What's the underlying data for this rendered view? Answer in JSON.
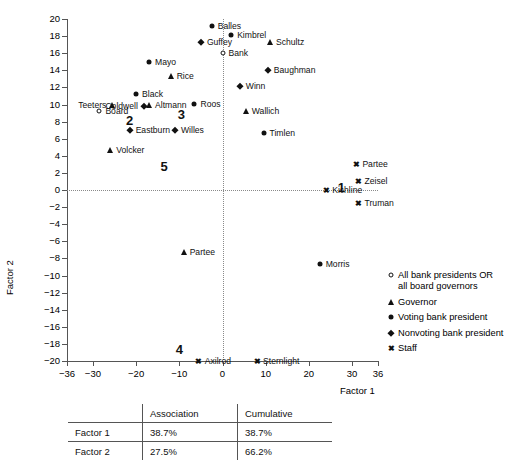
{
  "chart_data": {
    "type": "scatter",
    "title": "",
    "xlabel": "Factor 1",
    "ylabel": "Factor 2",
    "xlim": [
      -36,
      36
    ],
    "ylim": [
      -20,
      20
    ],
    "xticks": [
      -36,
      -30,
      -20,
      -10,
      0,
      10,
      20,
      30,
      36
    ],
    "yticks": [
      20,
      18,
      16,
      14,
      12,
      10,
      8,
      6,
      4,
      2,
      0,
      -2,
      -4,
      -6,
      -8,
      -10,
      -12,
      -14,
      -16,
      -18,
      -20
    ],
    "grid": false,
    "reference_lines": {
      "x": 0,
      "y": 0,
      "style": "dotted"
    },
    "legend_position": "right",
    "series": [
      {
        "name": "All bank presidents OR all board governors",
        "marker": "circle-open",
        "points": [
          {
            "label": "Bank",
            "x": 0.0,
            "y": 16.0,
            "side": "right"
          },
          {
            "label": "Board",
            "x": -28.5,
            "y": 9.2,
            "side": "right"
          }
        ]
      },
      {
        "name": "Governor",
        "marker": "triangle",
        "points": [
          {
            "label": "Schultz",
            "x": 11.0,
            "y": 17.3,
            "side": "right"
          },
          {
            "label": "Rice",
            "x": -12.0,
            "y": 13.3,
            "side": "right"
          },
          {
            "label": "Teeters",
            "x": -25.5,
            "y": 10.0,
            "side": "left"
          },
          {
            "label": "Altmann",
            "x": -17.0,
            "y": 9.9,
            "side": "right"
          },
          {
            "label": "Wallich",
            "x": 5.4,
            "y": 9.2,
            "side": "right"
          },
          {
            "label": "Volcker",
            "x": -26.0,
            "y": 4.7,
            "side": "right"
          },
          {
            "label": "Partee",
            "x": -9.0,
            "y": -7.2,
            "side": "right"
          }
        ]
      },
      {
        "name": "Voting bank president",
        "marker": "circle-filled",
        "points": [
          {
            "label": "Balles",
            "x": -2.5,
            "y": 19.2,
            "side": "right"
          },
          {
            "label": "Kimbrel",
            "x": 2.0,
            "y": 18.1,
            "side": "right"
          },
          {
            "label": "Mayo",
            "x": -17.0,
            "y": 15.0,
            "side": "right"
          },
          {
            "label": "Black",
            "x": -20.0,
            "y": 11.2,
            "side": "right"
          },
          {
            "label": "Roos",
            "x": -6.5,
            "y": 10.1,
            "side": "right"
          },
          {
            "label": "Timlen",
            "x": 9.5,
            "y": 6.7,
            "side": "right"
          },
          {
            "label": "Morris",
            "x": 22.5,
            "y": -8.7,
            "side": "right"
          }
        ]
      },
      {
        "name": "Nonvoting bank president",
        "marker": "diamond",
        "points": [
          {
            "label": "Guffey",
            "x": -5.0,
            "y": 17.3,
            "side": "right"
          },
          {
            "label": "Baughman",
            "x": 10.5,
            "y": 14.0,
            "side": "right"
          },
          {
            "label": "Winn",
            "x": 4.0,
            "y": 12.2,
            "side": "right"
          },
          {
            "label": "Coldwell",
            "x": -18.2,
            "y": 9.8,
            "side": "left"
          },
          {
            "label": "Eastburn",
            "x": -21.5,
            "y": 7.0,
            "side": "right"
          },
          {
            "label": "Willes",
            "x": -11.0,
            "y": 7.0,
            "side": "right"
          }
        ]
      },
      {
        "name": "Staff",
        "marker": "x",
        "points": [
          {
            "label": "Partee",
            "x": 31.0,
            "y": 3.0,
            "side": "right"
          },
          {
            "label": "Zeisel",
            "x": 31.5,
            "y": 1.0,
            "side": "right"
          },
          {
            "label": "Kichline",
            "x": 24.0,
            "y": 0.0,
            "side": "right"
          },
          {
            "label": "Truman",
            "x": 31.5,
            "y": -1.5,
            "side": "right"
          },
          {
            "label": "Axilrod",
            "x": -5.5,
            "y": -20.0,
            "side": "right"
          },
          {
            "label": "Sternlight",
            "x": 8.0,
            "y": -20.0,
            "side": "right"
          }
        ]
      }
    ],
    "cluster_labels": [
      {
        "text": "1",
        "x": 27.5,
        "y": 0.3
      },
      {
        "text": "2",
        "x": -21.5,
        "y": 8.2
      },
      {
        "text": "3",
        "x": -9.5,
        "y": 8.9
      },
      {
        "text": "4",
        "x": -10.0,
        "y": -18.6
      },
      {
        "text": "5",
        "x": -13.5,
        "y": 2.8
      }
    ]
  },
  "legend": {
    "items": [
      {
        "marker": "circle-open",
        "label": "All bank presidents OR\nall board governors"
      },
      {
        "marker": "triangle",
        "label": "Governor"
      },
      {
        "marker": "circle-filled",
        "label": "Voting bank president"
      },
      {
        "marker": "diamond",
        "label": "Nonvoting bank president"
      },
      {
        "marker": "x",
        "label": "Staff"
      }
    ]
  },
  "stats_table": {
    "columns": [
      "",
      "Association",
      "Cumulative"
    ],
    "rows": [
      {
        "name": "Factor 1",
        "association": "38.7%",
        "cumulative": "38.7%"
      },
      {
        "name": "Factor 2",
        "association": "27.5%",
        "cumulative": "66.2%"
      }
    ]
  }
}
